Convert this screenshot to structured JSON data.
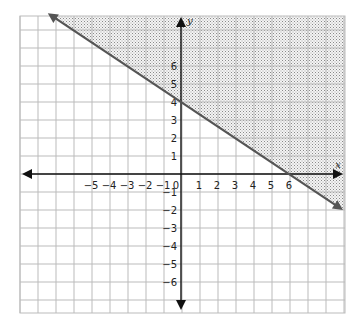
{
  "chart_data": {
    "type": "line",
    "title": "",
    "xlabel": "x",
    "ylabel": "y",
    "xlim": [
      -9,
      9
    ],
    "ylim": [
      -8,
      9
    ],
    "grid": true,
    "x_tick_labels": [
      "-5",
      "-4",
      "-3",
      "-2",
      "-1",
      "0",
      "1",
      "2",
      "3",
      "4",
      "5",
      "6"
    ],
    "y_tick_labels": [
      "6",
      "5",
      "4",
      "3",
      "2",
      "1",
      "-1",
      "-2",
      "-3",
      "-4",
      "-5",
      "-6"
    ],
    "series": [
      {
        "name": "boundary line",
        "style": "solid",
        "slope": -0.6667,
        "intercept": 4,
        "x": [
          -7.4,
          0,
          6,
          9
        ],
        "y": [
          8.9,
          4,
          0,
          -2
        ]
      }
    ],
    "shaded_region": "above line (y >= -2/3 x + 4)",
    "inequality": "y ≥ -2/3x + 4",
    "colors": {
      "line": "#555555",
      "grid": "#bbbbbb",
      "axis": "#111111",
      "shade_dot": "#888888"
    }
  }
}
